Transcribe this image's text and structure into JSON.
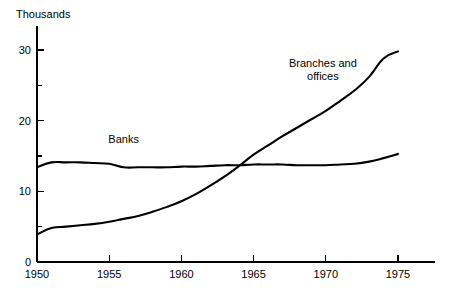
{
  "chart_data": {
    "type": "line",
    "title": "",
    "subtitle": "",
    "unit_label": "Thousands",
    "xlabel": "",
    "ylabel": "",
    "xlim": [
      1950,
      1975
    ],
    "ylim": [
      0,
      31
    ],
    "grid": false,
    "legend_position": "inline-annotations",
    "x_ticks": [
      {
        "value": 1950,
        "label": "1950",
        "major": true
      },
      {
        "value": 1955,
        "label": "1955",
        "major": true
      },
      {
        "value": 1960,
        "label": "1960",
        "major": true
      },
      {
        "value": 1965,
        "label": "1965",
        "major": true
      },
      {
        "value": 1970,
        "label": "1970",
        "major": true
      },
      {
        "value": 1975,
        "label": "1975",
        "major": true
      }
    ],
    "y_ticks": [
      {
        "value": 0,
        "label": "0",
        "major": true
      },
      {
        "value": 5,
        "label": "",
        "major": false
      },
      {
        "value": 10,
        "label": "10",
        "major": true
      },
      {
        "value": 15,
        "label": "",
        "major": false
      },
      {
        "value": 20,
        "label": "20",
        "major": true
      },
      {
        "value": 25,
        "label": "",
        "major": false
      },
      {
        "value": 30,
        "label": "30",
        "major": true
      }
    ],
    "series": [
      {
        "name": "Banks",
        "label": "Banks",
        "label_x": 1956.0,
        "label_y": 16.8,
        "color": "#000000",
        "x": [
          1950,
          1951,
          1952,
          1953,
          1954,
          1955,
          1956,
          1957,
          1958,
          1959,
          1960,
          1961,
          1962,
          1963,
          1964,
          1965,
          1966,
          1967,
          1968,
          1969,
          1970,
          1971,
          1972,
          1973,
          1974,
          1975
        ],
        "values": [
          13.4,
          14.1,
          14.1,
          14.1,
          14.0,
          13.9,
          13.4,
          13.4,
          13.4,
          13.4,
          13.5,
          13.5,
          13.6,
          13.7,
          13.7,
          13.8,
          13.8,
          13.8,
          13.7,
          13.7,
          13.7,
          13.8,
          13.9,
          14.2,
          14.7,
          15.3
        ]
      },
      {
        "name": "Branches and offices",
        "label": "Branches and offices",
        "label_line_1": "Branches and",
        "label_line_2": "offices",
        "label_x": 1969.8,
        "label_y": 27.6,
        "color": "#000000",
        "x": [
          1950,
          1951,
          1952,
          1953,
          1954,
          1955,
          1956,
          1957,
          1958,
          1959,
          1960,
          1961,
          1962,
          1963,
          1964,
          1965,
          1966,
          1967,
          1968,
          1969,
          1970,
          1971,
          1972,
          1973,
          1974,
          1975
        ],
        "values": [
          3.9,
          4.8,
          5.0,
          5.2,
          5.4,
          5.7,
          6.1,
          6.5,
          7.1,
          7.8,
          8.6,
          9.6,
          10.8,
          12.1,
          13.6,
          15.2,
          16.5,
          17.8,
          19.0,
          20.2,
          21.4,
          22.8,
          24.3,
          26.2,
          28.8,
          29.8
        ]
      }
    ],
    "annotations": [
      {
        "name": "crossover",
        "x": 1963.5,
        "y": 13.8
      }
    ]
  }
}
